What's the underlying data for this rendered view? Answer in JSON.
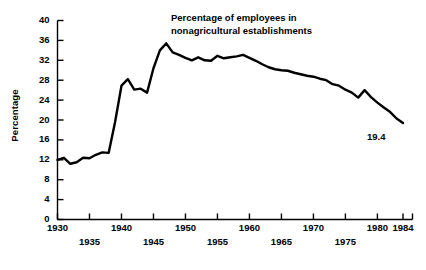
{
  "chart_data": {
    "type": "line",
    "title": "Percentage of employees in nonagricultural establishments",
    "title_line1": "Percentage of employees in",
    "title_line2": "nonagricultural establishments",
    "xlabel": "",
    "ylabel": "Percentage",
    "xlim": [
      1930,
      1984
    ],
    "ylim": [
      0,
      40
    ],
    "grid": false,
    "legend": "none",
    "line_color": "#000000",
    "axis_color": "#000000",
    "y_ticks": [
      0,
      4,
      8,
      12,
      16,
      20,
      24,
      28,
      32,
      36,
      40
    ],
    "y_tick_labels": [
      "0",
      "4",
      "8",
      "12",
      "16",
      "20",
      "24",
      "28",
      "32",
      "36",
      "40"
    ],
    "x_ticks": [
      1930,
      1935,
      1940,
      1945,
      1950,
      1955,
      1960,
      1965,
      1970,
      1975,
      1980,
      1984
    ],
    "x_tick_labels": [
      "1930",
      "1935",
      "1940",
      "1945",
      "1950",
      "1955",
      "1960",
      "1965",
      "1970",
      "1975",
      "1980",
      "1984"
    ],
    "x_tick_rows": [
      0,
      1,
      0,
      1,
      0,
      1,
      0,
      1,
      0,
      1,
      0,
      0
    ],
    "annotations": [
      {
        "text": "19.4",
        "x": 1984,
        "y": 19.4,
        "position": "below-right"
      }
    ],
    "x": [
      1930,
      1931,
      1932,
      1933,
      1934,
      1935,
      1936,
      1937,
      1938,
      1939,
      1940,
      1941,
      1942,
      1943,
      1944,
      1945,
      1946,
      1947,
      1948,
      1949,
      1950,
      1951,
      1952,
      1953,
      1954,
      1955,
      1956,
      1957,
      1958,
      1959,
      1960,
      1961,
      1962,
      1963,
      1964,
      1965,
      1966,
      1967,
      1968,
      1969,
      1970,
      1971,
      1972,
      1973,
      1974,
      1975,
      1976,
      1977,
      1978,
      1979,
      1980,
      1981,
      1982,
      1983,
      1984
    ],
    "values": [
      12.0,
      12.4,
      11.2,
      11.5,
      12.4,
      12.3,
      13.0,
      13.5,
      13.4,
      19.6,
      26.9,
      28.2,
      26.1,
      26.3,
      25.5,
      30.4,
      34.0,
      35.4,
      33.6,
      33.1,
      32.5,
      32.0,
      32.6,
      32.0,
      31.9,
      32.9,
      32.4,
      32.6,
      32.8,
      33.1,
      32.5,
      31.9,
      31.2,
      30.6,
      30.2,
      30.0,
      29.9,
      29.5,
      29.2,
      28.9,
      28.7,
      28.3,
      28.0,
      27.2,
      26.9,
      26.1,
      25.5,
      24.5,
      26.0,
      24.6,
      23.5,
      22.5,
      21.6,
      20.3,
      19.4
    ]
  }
}
